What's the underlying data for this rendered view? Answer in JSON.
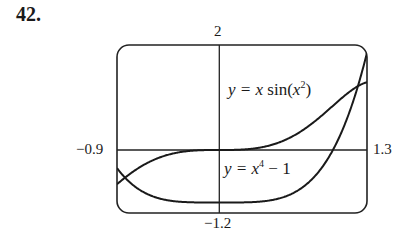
{
  "problem": {
    "number": "42."
  },
  "chart_data": {
    "type": "line",
    "title": "",
    "xlabel": "",
    "ylabel": "",
    "xlim": [
      -0.9,
      1.3
    ],
    "ylim": [
      -1.2,
      2
    ],
    "grid": false,
    "legend": "inline labels",
    "tick_labels": {
      "x_min": "−0.9",
      "x_max": "1.3",
      "y_max": "2",
      "y_min": "−1.2"
    },
    "series": [
      {
        "name": "y = x sin(x²)",
        "expression": "x*sin(x^2)",
        "label": {
          "prefix": "y = ",
          "var": "x",
          "func": "sin(",
          "inner": "x",
          "exp": "2",
          "suffix": ")"
        }
      },
      {
        "name": "y = x⁴ − 1",
        "expression": "x^4 - 1",
        "label": {
          "prefix": "y = ",
          "var": "x",
          "exp": "4",
          "suffix": " − 1"
        }
      }
    ]
  }
}
